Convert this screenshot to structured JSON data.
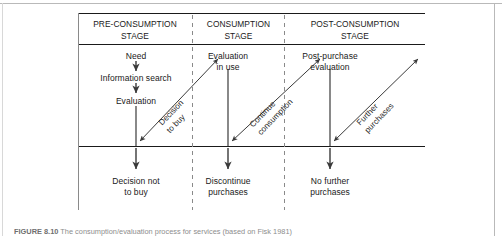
{
  "figure": {
    "columns": [
      {
        "id": "pre-consumption",
        "title_line1": "PRE-CONSUMPTION",
        "title_line2": "STAGE"
      },
      {
        "id": "consumption",
        "title_line1": "CONSUMPTION",
        "title_line2": "STAGE"
      },
      {
        "id": "post-consumption",
        "title_line1": "POST-CONSUMPTION",
        "title_line2": "STAGE"
      }
    ],
    "upper_nodes": {
      "pre_1": "Need",
      "pre_2": "Information search",
      "pre_3": "Evaluation",
      "con_1_line1": "Evaluation",
      "con_1_line2": "in use",
      "post_1_line1": "Post-purchase",
      "post_1_line2": "evaluation"
    },
    "lower_nodes": {
      "pre_outcome_line1": "Decision not",
      "pre_outcome_line2": "to buy",
      "con_outcome_line1": "Discontinue",
      "con_outcome_line2": "purchases",
      "post_outcome_line1": "No further",
      "post_outcome_line2": "purchases"
    },
    "diagonal_labels": {
      "decision_to_buy_line1": "Decision",
      "decision_to_buy_line2": "to buy",
      "continue_consumption_line1": "Continue",
      "continue_consumption_line2": "consumption",
      "further_purchases_line1": "Further",
      "further_purchases_line2": "purchases"
    },
    "colors": {
      "rule": "#1a1a1a",
      "divider": "#8a8a8a",
      "arrow": "#3a3a3a",
      "text": "#1a1a1a",
      "page_rule": "#b9b9b9"
    }
  },
  "caption": {
    "number": "FIGURE 8.10",
    "text": "The consumption/evaluation process for services (based on Fisk 1981)"
  }
}
